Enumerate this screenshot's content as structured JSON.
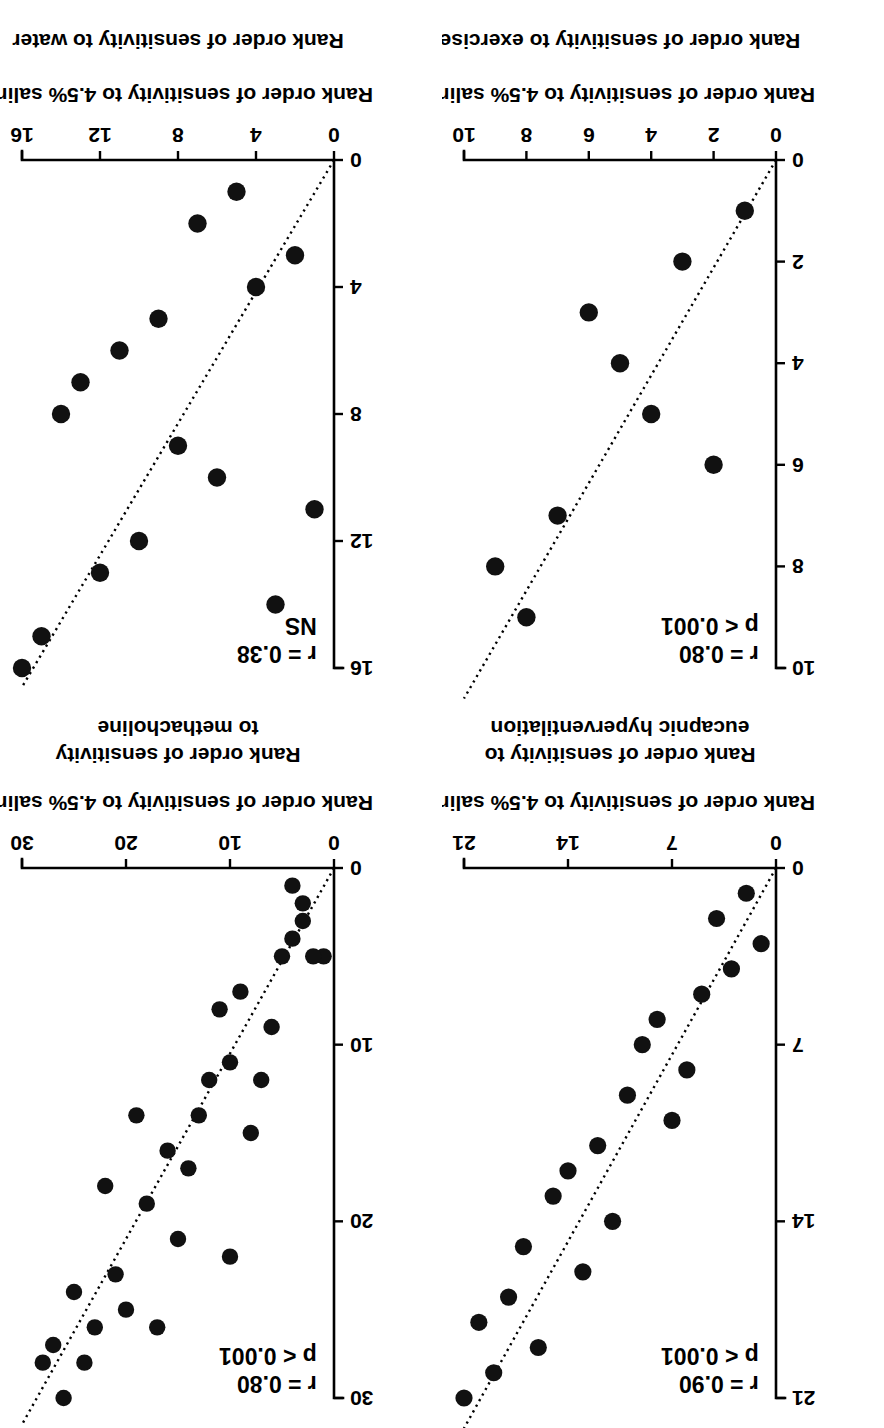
{
  "figure": {
    "orientation_note": "rotated-180",
    "panel_count": 4,
    "shared_xlabel": "Rank order of sensitivity to 4.5% saline",
    "marker_color": "#111111",
    "axis_color": "#000000"
  },
  "chart_data": [
    {
      "id": "panel-eucapnic-hyperventilation",
      "type": "scatter",
      "title": "",
      "xlabel": "Rank order of sensitivity to 4.5% saline",
      "ylabel": "Rank order of sensitivity to\neucapnic hyperventilation",
      "ylabel_lines": [
        "Rank order of sensitivity to",
        "eucapnic hyperventilation"
      ],
      "xlim": [
        0,
        21
      ],
      "ylim": [
        0,
        21
      ],
      "xticks": [
        0,
        7,
        14,
        21
      ],
      "yticks": [
        0,
        7,
        14,
        21
      ],
      "xticklabels": [
        "0",
        "7",
        "14",
        "21"
      ],
      "yticklabels": [
        "0",
        "7",
        "14",
        "21"
      ],
      "grid": false,
      "legend": "none",
      "annotations": {
        "r_label": "r = 0.90",
        "p_label": "p < 0.001"
      },
      "fit_line": {
        "style": "dotted",
        "x0": 0,
        "y0": 0,
        "x1": 21,
        "y1": 22.2
      },
      "x": [
        1,
        2,
        3,
        4,
        5,
        6,
        7,
        8,
        9,
        10,
        11,
        12,
        13,
        14,
        15,
        16,
        17,
        18,
        19,
        20,
        21
      ],
      "y": [
        3,
        1,
        4,
        2,
        5,
        8,
        10,
        6,
        7,
        9,
        14,
        11,
        16,
        12,
        13,
        19,
        15,
        17,
        20,
        18,
        21
      ],
      "n": 21
    },
    {
      "id": "panel-exercise",
      "type": "scatter",
      "title": "",
      "xlabel": "Rank order of sensitivity to 4.5% saline",
      "ylabel": "Rank order of sensitivity to exercise",
      "ylabel_lines": [
        "Rank order of sensitivity to exercise"
      ],
      "xlim": [
        0,
        10
      ],
      "ylim": [
        0,
        10
      ],
      "xticks": [
        0,
        2,
        4,
        6,
        8,
        10
      ],
      "yticks": [
        0,
        2,
        4,
        6,
        8,
        10
      ],
      "xticklabels": [
        "0",
        "2",
        "4",
        "6",
        "8",
        "10"
      ],
      "yticklabels": [
        "0",
        "2",
        "4",
        "6",
        "8",
        "10"
      ],
      "grid": false,
      "legend": "none",
      "annotations": {
        "r_label": "r = 0.80",
        "p_label": "p < 0.001"
      },
      "fit_line": {
        "style": "dotted",
        "x0": 0,
        "y0": 0,
        "x1": 10,
        "y1": 10.6
      },
      "x": [
        1,
        2,
        3,
        4,
        5,
        6,
        7,
        8,
        9
      ],
      "y": [
        1,
        6,
        2,
        5,
        4,
        3,
        7,
        9,
        8
      ],
      "n": 9
    },
    {
      "id": "panel-methacholine",
      "type": "scatter",
      "title": "",
      "xlabel": "Rank order of sensitivity to 4.5% saline",
      "ylabel": "Rank order of sensitivity\nto methacholine",
      "ylabel_lines": [
        "Rank order of sensitivity",
        "to methacholine"
      ],
      "xlim": [
        0,
        30
      ],
      "ylim": [
        0,
        30
      ],
      "xticks": [
        0,
        10,
        20,
        30
      ],
      "yticks": [
        0,
        10,
        20,
        30
      ],
      "xticklabels": [
        "0",
        "10",
        "20",
        "30"
      ],
      "yticklabels": [
        "0",
        "10",
        "20",
        "30"
      ],
      "grid": false,
      "legend": "none",
      "annotations": {
        "r_label": "r = 0.80",
        "p_label": "p < 0.001"
      },
      "fit_line": {
        "style": "dotted",
        "x0": 0,
        "y0": 0,
        "x1": 30,
        "y1": 31.5
      },
      "x": [
        1,
        2,
        3,
        3,
        4,
        4,
        5,
        6,
        7,
        8,
        9,
        10,
        10,
        11,
        12,
        13,
        14,
        15,
        16,
        17,
        18,
        19,
        20,
        21,
        22,
        23,
        24,
        25,
        26,
        27,
        28
      ],
      "y": [
        5,
        5,
        2,
        3,
        1,
        4,
        5,
        9,
        12,
        15,
        7,
        11,
        22,
        8,
        12,
        14,
        17,
        21,
        16,
        26,
        19,
        14,
        25,
        23,
        18,
        26,
        28,
        24,
        30,
        27,
        28
      ],
      "n": 31
    },
    {
      "id": "panel-water",
      "type": "scatter",
      "title": "",
      "xlabel": "Rank order of sensitivity to 4.5% saline",
      "ylabel": "Rank order of sensitivity to water",
      "ylabel_lines": [
        "Rank order of sensitivity to water"
      ],
      "xlim": [
        0,
        16
      ],
      "ylim": [
        0,
        16
      ],
      "xticks": [
        0,
        4,
        8,
        12,
        16
      ],
      "yticks": [
        0,
        4,
        8,
        12,
        16
      ],
      "xticklabels": [
        "0",
        "4",
        "8",
        "12",
        "16"
      ],
      "yticklabels": [
        "0",
        "4",
        "8",
        "12",
        "16"
      ],
      "grid": false,
      "legend": "none",
      "annotations": {
        "r_label": "r = 0.38",
        "p_label": "NS"
      },
      "fit_line": {
        "style": "dotted",
        "x0": 0,
        "y0": 0,
        "x1": 16,
        "y1": 16.6
      },
      "x": [
        1,
        2,
        3,
        4,
        5,
        6,
        7,
        8,
        9,
        10,
        11,
        12,
        13,
        14,
        15,
        16
      ],
      "y": [
        11,
        3,
        14,
        4,
        1,
        10,
        2,
        9,
        5,
        12,
        6,
        13,
        7,
        8,
        15,
        16
      ],
      "n": 16
    }
  ]
}
